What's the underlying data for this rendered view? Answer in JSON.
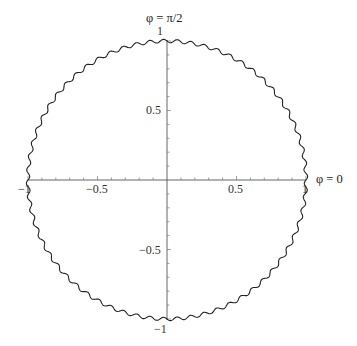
{
  "chart_data": {
    "type": "line",
    "title": "",
    "subtitle": "",
    "xlabel": "",
    "ylabel": "",
    "xlim": [
      -1.0,
      1.0
    ],
    "ylim": [
      -1.0,
      1.0
    ],
    "grid": false,
    "legend": null,
    "x_ticks": [
      -1,
      -0.5,
      0.5,
      1
    ],
    "x_tick_labels": [
      "−1",
      "−0.5",
      "0.5",
      "1"
    ],
    "y_ticks": [
      1,
      0.5,
      -0.5,
      -1
    ],
    "y_tick_labels": [
      "1",
      "0.5",
      "−0.5",
      "−1"
    ],
    "annotations": [
      {
        "text": "φ = π/2",
        "at": "top of vertical axis"
      },
      {
        "text": "φ = 0",
        "at": "right end of horizontal axis"
      }
    ],
    "series": [
      {
        "name": "wavy circle",
        "base_radius": 1.0,
        "ripple_amplitude": 0.012,
        "ripple_count": 64,
        "color": "#222222"
      }
    ]
  },
  "labels": {
    "phi_top": "φ = π/2",
    "phi_right": "φ = 0",
    "x_neg1": "−1",
    "x_neg05": "−0.5",
    "x_05": "0.5",
    "x_1": "1",
    "y_1": "1",
    "y_05": "0.5",
    "y_neg05": "−0.5",
    "y_neg1": "−1"
  }
}
